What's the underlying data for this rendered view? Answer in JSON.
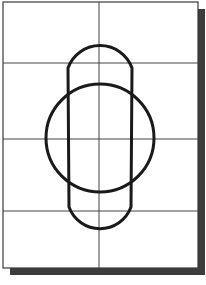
{
  "diagram": {
    "type": "technical-sketch",
    "sheet": {
      "x": 3,
      "y": 2,
      "width": 195,
      "height": 266,
      "border_color": "#3a3a3a",
      "background": "#ffffff"
    },
    "shadow": {
      "offset": 7,
      "color": "#3c3c3c"
    },
    "grid": {
      "line_color": "#444444",
      "vertical_lines_x": [
        99
      ],
      "horizontal_lines_y": [
        63,
        139,
        211
      ]
    },
    "shapes": {
      "stroke_color": "#1a1a1a",
      "stroke_width": 3,
      "circle": {
        "cx": 100,
        "cy": 138,
        "r": 54
      },
      "capsule": {
        "top_arc_center": [
          100,
          62
        ],
        "top_arc_radius": 34,
        "bottom_arc_center": [
          100,
          215
        ],
        "bottom_arc_radius": 33,
        "left_tangent": [
          [
            66,
            57
          ],
          [
            47,
            122
          ]
        ],
        "right_tangent": [
          [
            134,
            57
          ],
          [
            152,
            122
          ]
        ]
      }
    }
  }
}
